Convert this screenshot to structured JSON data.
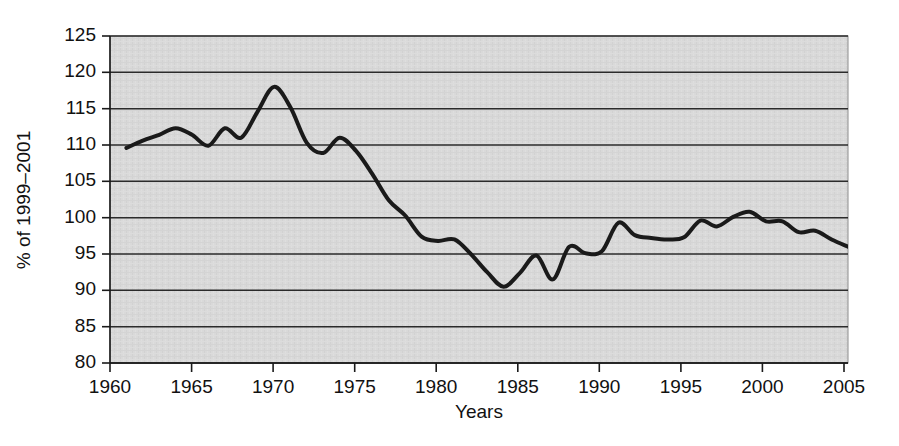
{
  "chart_data": {
    "type": "line",
    "title": "",
    "subtitle": "",
    "xlabel": "Years",
    "ylabel": "% of 1999–2001",
    "xlim": [
      1960,
      2005
    ],
    "ylim": [
      80,
      125
    ],
    "xticks": [
      "1960",
      "1965",
      "1970",
      "1975",
      "1980",
      "1985",
      "1990",
      "1995",
      "2000",
      "2005"
    ],
    "yticks": [
      "80",
      "85",
      "90",
      "95",
      "100",
      "105",
      "110",
      "115",
      "120",
      "125"
    ],
    "grid": "horizontal",
    "legend": "none",
    "plot_background": "#d8d8d8",
    "line_color": "#1a1a1a",
    "line_width": 4,
    "series": [
      {
        "name": "index",
        "x": [
          1961,
          1962,
          1963,
          1964,
          1965,
          1966,
          1967,
          1968,
          1969,
          1970,
          1971,
          1972,
          1973,
          1974,
          1975,
          1976,
          1977,
          1978,
          1979,
          1980,
          1981,
          1982,
          1983,
          1984,
          1985,
          1986,
          1987,
          1988,
          1989,
          1990,
          1991,
          1992,
          1993,
          1994,
          1995,
          1996,
          1997,
          1998,
          1999,
          2000,
          2001,
          2002,
          2003,
          2004,
          2005
        ],
        "values": [
          109.6,
          110.6,
          111.4,
          112.3,
          111.4,
          109.9,
          112.3,
          111.0,
          114.6,
          118.0,
          115.2,
          110.3,
          108.9,
          111.0,
          109.2,
          106.0,
          102.4,
          100.3,
          97.4,
          96.8,
          97.0,
          95.0,
          92.5,
          90.5,
          92.4,
          94.8,
          91.5,
          96.0,
          95.1,
          95.4,
          99.3,
          97.6,
          97.2,
          97.0,
          97.3,
          99.6,
          98.8,
          100.1,
          100.8,
          99.5,
          99.5,
          98.0,
          98.2,
          97.0,
          96.0
        ]
      }
    ]
  },
  "axes": {
    "y_title": "% of 1999–2001",
    "x_title": "Years"
  }
}
